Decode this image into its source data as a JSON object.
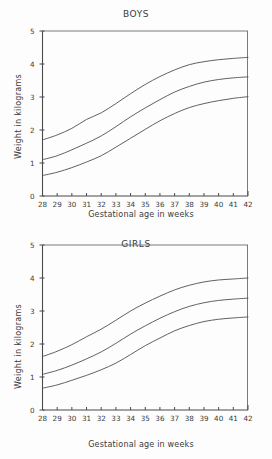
{
  "chart_data": [
    {
      "type": "line",
      "title": "BOYS",
      "xlabel": "Gestational age in weeks",
      "ylabel": "Weight in kilograms",
      "x": [
        28,
        29,
        30,
        31,
        32,
        33,
        34,
        35,
        36,
        37,
        38,
        39,
        40,
        41,
        42
      ],
      "xticklabels": [
        "28",
        "29",
        "30",
        "31",
        "32",
        "33",
        "34",
        "35",
        "36",
        "37",
        "38",
        "39",
        "40",
        "41",
        "42"
      ],
      "yticklabels": [
        "0",
        "1",
        "2",
        "3",
        "4",
        "5"
      ],
      "xlim": [
        28,
        42
      ],
      "ylim": [
        0,
        5
      ],
      "grid": false,
      "legend": "none",
      "series": [
        {
          "name": "90th percentile",
          "values": [
            1.7,
            1.85,
            2.05,
            2.32,
            2.52,
            2.8,
            3.1,
            3.38,
            3.62,
            3.82,
            3.98,
            4.07,
            4.13,
            4.17,
            4.2
          ]
        },
        {
          "name": "50th percentile",
          "values": [
            1.1,
            1.22,
            1.4,
            1.6,
            1.82,
            2.1,
            2.4,
            2.67,
            2.92,
            3.15,
            3.32,
            3.45,
            3.53,
            3.58,
            3.61
          ]
        },
        {
          "name": "10th percentile",
          "values": [
            0.62,
            0.72,
            0.86,
            1.03,
            1.22,
            1.48,
            1.75,
            2.02,
            2.28,
            2.5,
            2.68,
            2.8,
            2.89,
            2.96,
            3.01
          ]
        }
      ]
    },
    {
      "type": "line",
      "title": "GIRLS",
      "xlabel": "Gestational age in weeks",
      "ylabel": "Weight in kilograms",
      "x": [
        28,
        29,
        30,
        31,
        32,
        33,
        34,
        35,
        36,
        37,
        38,
        39,
        40,
        41,
        42
      ],
      "xticklabels": [
        "28",
        "29",
        "30",
        "31",
        "32",
        "33",
        "34",
        "35",
        "36",
        "37",
        "38",
        "39",
        "40",
        "41",
        "42"
      ],
      "yticklabels": [
        "0",
        "1",
        "2",
        "3",
        "4",
        "5"
      ],
      "xlim": [
        28,
        42
      ],
      "ylim": [
        0,
        5
      ],
      "grid": false,
      "legend": "none",
      "series": [
        {
          "name": "90th percentile",
          "values": [
            1.62,
            1.78,
            1.98,
            2.22,
            2.45,
            2.72,
            3.0,
            3.24,
            3.45,
            3.64,
            3.78,
            3.88,
            3.94,
            3.97,
            4.0
          ]
        },
        {
          "name": "50th percentile",
          "values": [
            1.08,
            1.2,
            1.36,
            1.55,
            1.76,
            2.02,
            2.3,
            2.55,
            2.78,
            2.98,
            3.14,
            3.25,
            3.32,
            3.36,
            3.39
          ]
        },
        {
          "name": "10th percentile",
          "values": [
            0.66,
            0.76,
            0.9,
            1.05,
            1.22,
            1.42,
            1.68,
            1.95,
            2.18,
            2.4,
            2.56,
            2.68,
            2.75,
            2.79,
            2.82
          ]
        }
      ]
    }
  ],
  "figure": {
    "boys": {
      "title": "BOYS",
      "xlabel": "Gestational age in weeks",
      "ylabel": "Weight in kilograms"
    },
    "girls": {
      "title": "GIRLS",
      "xlabel": "Gestational age in weeks",
      "ylabel": "Weight in kilograms"
    },
    "colors": {
      "curve": "#4f4f4f",
      "axis": "#4a4a4a",
      "frame": "#6b6b6b",
      "text": "#3a3a3a",
      "background": "#fdfdfd"
    }
  }
}
